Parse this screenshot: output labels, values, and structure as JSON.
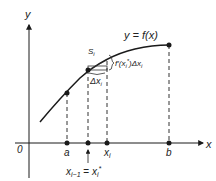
{
  "diagram": {
    "type": "calculus-differential-approximation",
    "colors": {
      "ink": "#1a1a1a",
      "dash": "#333333",
      "background": "#ffffff"
    },
    "axes": {
      "y_label": "y",
      "x_label": "x",
      "origin_label": "0"
    },
    "curve_label": "y = f(x)",
    "points": {
      "a": "a",
      "x_i": "x",
      "x_i_sub": "i",
      "b": "b",
      "bottom_left": "x",
      "bottom_left_sub": "i−1",
      "bottom_eq": " = ",
      "bottom_right": "x",
      "bottom_right_sub": "i",
      "bottom_right_sup": "*"
    },
    "segment_label": "S",
    "segment_sub": "i",
    "increment_label": "Δx",
    "increment_sub": "i",
    "brace_label": "f′(x",
    "brace_sub": "i",
    "brace_sup": "*",
    "brace_tail": ")Δx",
    "brace_tail_sub": "i"
  }
}
